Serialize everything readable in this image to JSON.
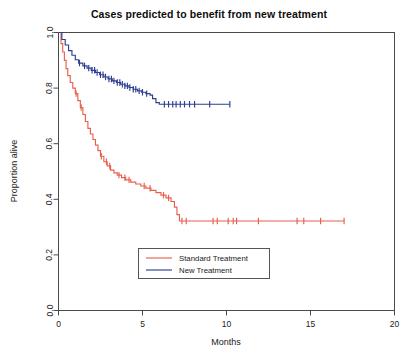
{
  "chart_data": {
    "type": "line",
    "title": "Cases predicted to benefit from new treatment",
    "xlabel": "Months",
    "ylabel": "Proportion alive",
    "xlim": [
      0,
      20
    ],
    "ylim": [
      0.0,
      1.0
    ],
    "xticks": [
      0,
      5,
      10,
      15,
      20
    ],
    "xtick_labels": [
      "0",
      "5",
      "10",
      "15",
      "20"
    ],
    "yticks": [
      0.0,
      0.2,
      0.4,
      0.6,
      0.8,
      1.0
    ],
    "ytick_labels": [
      "0.0",
      "0.2",
      "0.4",
      "0.6",
      "0.8",
      "1.0"
    ],
    "grid": false,
    "legend_position": "lower center",
    "plot_style": "kaplan-meier step function with censoring tick marks",
    "series": [
      {
        "name": "Standard Treatment",
        "color": "#e8604c",
        "final_value": 0.32,
        "max_x": 17.0,
        "points": [
          [
            0.0,
            1.0
          ],
          [
            0.15,
            0.96
          ],
          [
            0.25,
            0.93
          ],
          [
            0.35,
            0.9
          ],
          [
            0.45,
            0.87
          ],
          [
            0.55,
            0.845
          ],
          [
            0.7,
            0.82
          ],
          [
            0.85,
            0.8
          ],
          [
            1.0,
            0.78
          ],
          [
            1.15,
            0.755
          ],
          [
            1.3,
            0.73
          ],
          [
            1.45,
            0.705
          ],
          [
            1.6,
            0.68
          ],
          [
            1.75,
            0.655
          ],
          [
            1.9,
            0.635
          ],
          [
            2.05,
            0.615
          ],
          [
            2.2,
            0.595
          ],
          [
            2.35,
            0.575
          ],
          [
            2.5,
            0.555
          ],
          [
            2.7,
            0.535
          ],
          [
            2.9,
            0.52
          ],
          [
            3.1,
            0.505
          ],
          [
            3.3,
            0.495
          ],
          [
            3.5,
            0.487
          ],
          [
            3.75,
            0.478
          ],
          [
            4.0,
            0.47
          ],
          [
            4.3,
            0.462
          ],
          [
            4.6,
            0.455
          ],
          [
            4.9,
            0.448
          ],
          [
            5.2,
            0.44
          ],
          [
            5.5,
            0.432
          ],
          [
            5.8,
            0.424
          ],
          [
            6.1,
            0.415
          ],
          [
            6.4,
            0.405
          ],
          [
            6.7,
            0.392
          ],
          [
            6.9,
            0.372
          ],
          [
            7.05,
            0.345
          ],
          [
            7.2,
            0.322
          ],
          [
            17.0,
            0.322
          ]
        ],
        "censor_times": [
          1.05,
          1.35,
          2.55,
          2.85,
          3.05,
          3.6,
          3.95,
          4.2,
          5.1,
          5.45,
          6.25,
          6.55,
          7.35,
          7.6,
          9.2,
          9.45,
          10.1,
          10.4,
          10.6,
          11.9,
          14.2,
          14.6,
          15.6,
          17.0
        ]
      },
      {
        "name": "New Treatment",
        "color": "#2d3f8f",
        "final_value": 0.74,
        "max_x": 10.2,
        "points": [
          [
            0.0,
            1.0
          ],
          [
            0.2,
            0.975
          ],
          [
            0.4,
            0.955
          ],
          [
            0.6,
            0.935
          ],
          [
            0.8,
            0.918
          ],
          [
            1.0,
            0.902
          ],
          [
            1.2,
            0.89
          ],
          [
            1.45,
            0.88
          ],
          [
            1.7,
            0.872
          ],
          [
            1.95,
            0.864
          ],
          [
            2.2,
            0.856
          ],
          [
            2.45,
            0.848
          ],
          [
            2.7,
            0.84
          ],
          [
            2.95,
            0.833
          ],
          [
            3.2,
            0.826
          ],
          [
            3.45,
            0.82
          ],
          [
            3.7,
            0.814
          ],
          [
            3.95,
            0.808
          ],
          [
            4.2,
            0.802
          ],
          [
            4.45,
            0.796
          ],
          [
            4.7,
            0.79
          ],
          [
            4.95,
            0.785
          ],
          [
            5.2,
            0.78
          ],
          [
            5.45,
            0.775
          ],
          [
            5.6,
            0.762
          ],
          [
            5.8,
            0.748
          ],
          [
            6.0,
            0.742
          ],
          [
            10.2,
            0.742
          ]
        ],
        "censor_times": [
          1.25,
          1.55,
          1.8,
          2.0,
          2.15,
          2.3,
          2.5,
          2.65,
          2.8,
          3.0,
          3.15,
          3.3,
          3.5,
          3.65,
          3.8,
          3.95,
          4.1,
          4.25,
          4.45,
          4.6,
          4.8,
          5.0,
          5.25,
          6.3,
          6.55,
          6.8,
          7.0,
          7.25,
          7.5,
          7.8,
          8.1,
          9.0,
          10.2
        ]
      }
    ]
  },
  "legend": {
    "entries": [
      {
        "label": "Standard Treatment",
        "color": "#e8604c"
      },
      {
        "label": "New Treatment",
        "color": "#2d3f8f"
      }
    ]
  },
  "colors": {
    "standard": "#e8604c",
    "new": "#2d3f8f",
    "axis": "#4a4a4a",
    "text": "#1a1a1a",
    "background": "#ffffff"
  }
}
